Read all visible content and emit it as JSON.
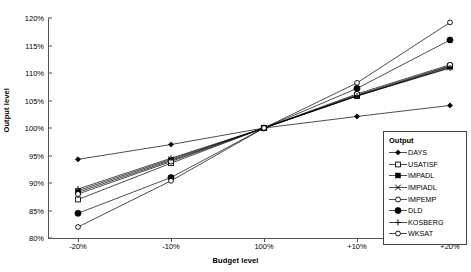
{
  "chart_data": {
    "type": "line",
    "title": "",
    "xlabel": "Budget level",
    "ylabel": "Output level",
    "categories": [
      "-20%",
      "-10%",
      "100%",
      "+10%",
      "+20%"
    ],
    "ylim": [
      80,
      120
    ],
    "yticks": [
      "80%",
      "85%",
      "90%",
      "95%",
      "100%",
      "105%",
      "110%",
      "115%",
      "120%"
    ],
    "ytick_values": [
      80,
      85,
      90,
      95,
      100,
      105,
      110,
      115,
      120
    ],
    "grid": false,
    "legend_position": "right-inside",
    "legend_title": "Output",
    "series": [
      {
        "name": "DAYS",
        "marker": "filled-diamond",
        "values": [
          94.3,
          97.0,
          100,
          102.1,
          104.1
        ]
      },
      {
        "name": "USATISF",
        "marker": "open-square",
        "values": [
          87.0,
          93.6,
          100,
          105.8,
          111.2
        ]
      },
      {
        "name": "IMPADL",
        "marker": "filled-square",
        "values": [
          88.3,
          94.1,
          100,
          106.0,
          111.3
        ]
      },
      {
        "name": "IMPIADL",
        "marker": "cross-x",
        "values": [
          88.6,
          94.3,
          100,
          105.9,
          111.0
        ]
      },
      {
        "name": "IMPEMP",
        "marker": "open-circle",
        "values": [
          88.0,
          93.9,
          100,
          106.2,
          111.5
        ]
      },
      {
        "name": "DLD",
        "marker": "large-filled-circle",
        "values": [
          84.5,
          91.0,
          100,
          107.2,
          116.0
        ]
      },
      {
        "name": "KOSBERG",
        "marker": "plus",
        "values": [
          88.9,
          94.5,
          100,
          105.8,
          110.9
        ]
      },
      {
        "name": "WKSAT",
        "marker": "open-circle-small",
        "values": [
          82.0,
          90.4,
          100,
          108.2,
          119.2
        ]
      }
    ]
  },
  "axes": {
    "x_title": "Budget level",
    "y_title": "Output level"
  },
  "legend": {
    "title": "Output",
    "items": [
      {
        "label": "DAYS"
      },
      {
        "label": "USATISF"
      },
      {
        "label": "IMPADL"
      },
      {
        "label": "IMPIADL"
      },
      {
        "label": "IMPEMP"
      },
      {
        "label": "DLD"
      },
      {
        "label": "KOSBERG"
      },
      {
        "label": "WKSAT"
      }
    ]
  }
}
